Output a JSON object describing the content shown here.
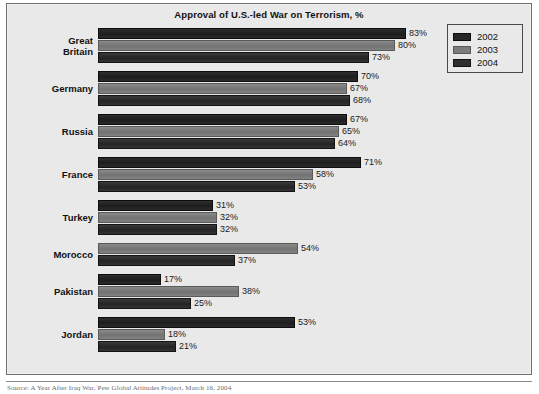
{
  "chart_data": {
    "type": "bar",
    "orientation": "horizontal",
    "title": "Approval of U.S.-led War on Terrorism, %",
    "xlabel": "",
    "ylabel": "",
    "xlim": [
      0,
      100
    ],
    "grid": false,
    "legend_position": "top-right",
    "value_suffix": "%",
    "categories": [
      "Great Britain",
      "Germany",
      "Russia",
      "France",
      "Turkey",
      "Morocco",
      "Pakistan",
      "Jordan"
    ],
    "series": [
      {
        "name": "2002",
        "color": "#262626",
        "values": [
          83,
          70,
          67,
          71,
          31,
          null,
          17,
          53
        ]
      },
      {
        "name": "2003",
        "color": "#7c7c7c",
        "values": [
          80,
          67,
          65,
          58,
          32,
          54,
          38,
          18
        ]
      },
      {
        "name": "2004",
        "color": "#2f2f2f",
        "values": [
          73,
          68,
          64,
          53,
          32,
          37,
          25,
          21
        ]
      }
    ],
    "groups": [
      {
        "label": "Great Britain",
        "label_lines": [
          "Great",
          "Britain"
        ],
        "bars": [
          {
            "series": "2002",
            "value": 83,
            "label": "83%"
          },
          {
            "series": "2003",
            "value": 80,
            "label": "80%"
          },
          {
            "series": "2004",
            "value": 73,
            "label": "73%"
          }
        ]
      },
      {
        "label": "Germany",
        "label_lines": [
          "Germany"
        ],
        "bars": [
          {
            "series": "2002",
            "value": 70,
            "label": "70%"
          },
          {
            "series": "2003",
            "value": 67,
            "label": "67%"
          },
          {
            "series": "2004",
            "value": 68,
            "label": "68%"
          }
        ]
      },
      {
        "label": "Russia",
        "label_lines": [
          "Russia"
        ],
        "bars": [
          {
            "series": "2002",
            "value": 67,
            "label": "67%"
          },
          {
            "series": "2003",
            "value": 65,
            "label": "65%"
          },
          {
            "series": "2004",
            "value": 64,
            "label": "64%"
          }
        ]
      },
      {
        "label": "France",
        "label_lines": [
          "France"
        ],
        "bars": [
          {
            "series": "2002",
            "value": 71,
            "label": "71%"
          },
          {
            "series": "2003",
            "value": 58,
            "label": "58%"
          },
          {
            "series": "2004",
            "value": 53,
            "label": "53%"
          }
        ]
      },
      {
        "label": "Turkey",
        "label_lines": [
          "Turkey"
        ],
        "bars": [
          {
            "series": "2002",
            "value": 31,
            "label": "31%"
          },
          {
            "series": "2003",
            "value": 32,
            "label": "32%"
          },
          {
            "series": "2004",
            "value": 32,
            "label": "32%"
          }
        ]
      },
      {
        "label": "Morocco",
        "label_lines": [
          "Morocco"
        ],
        "bars": [
          {
            "series": "2003",
            "value": 54,
            "label": "54%"
          },
          {
            "series": "2004",
            "value": 37,
            "label": "37%"
          }
        ]
      },
      {
        "label": "Pakistan",
        "label_lines": [
          "Pakistan"
        ],
        "bars": [
          {
            "series": "2002",
            "value": 17,
            "label": "17%"
          },
          {
            "series": "2003",
            "value": 38,
            "label": "38%"
          },
          {
            "series": "2004",
            "value": 25,
            "label": "25%"
          }
        ]
      },
      {
        "label": "Jordan",
        "label_lines": [
          "Jordan"
        ],
        "bars": [
          {
            "series": "2002",
            "value": 53,
            "label": "53%"
          },
          {
            "series": "2003",
            "value": 18,
            "label": "18%"
          },
          {
            "series": "2004",
            "value": 21,
            "label": "21%"
          }
        ]
      }
    ]
  },
  "legend": {
    "entries": [
      {
        "label": "2002",
        "color": "#262626"
      },
      {
        "label": "2003",
        "color": "#7c7c7c"
      },
      {
        "label": "2004",
        "color": "#2f2f2f"
      }
    ]
  },
  "footer": {
    "source": "Source: A Year After Iraq War, Pew Global Attitudes Project, March 16, 2004"
  }
}
